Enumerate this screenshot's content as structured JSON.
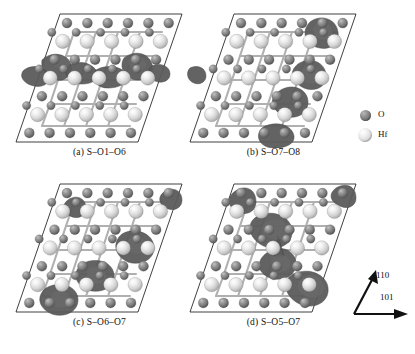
{
  "figure": {
    "kind": "crystal-structure-isosurface-grid",
    "background": "#ffffff",
    "width": 415,
    "height": 354
  },
  "panels": [
    {
      "id": "panel-a",
      "caption": "(a) S–O1–O6",
      "label_letter": "(a)",
      "label_text": "S–O1–O6",
      "position": {
        "left": 12,
        "top": 8
      }
    },
    {
      "id": "panel-b",
      "caption": "(b) S–O7–O8",
      "label_letter": "(b)",
      "label_text": "S–O7–O8",
      "position": {
        "left": 186,
        "top": 8
      }
    },
    {
      "id": "panel-c",
      "caption": "(c) S–O6–O7",
      "label_letter": "(c)",
      "label_text": "S–O6–O7",
      "position": {
        "left": 12,
        "top": 178
      }
    },
    {
      "id": "panel-d",
      "caption": "(d) S–O5–O7",
      "label_letter": "(d)",
      "label_text": "S–O5–O7",
      "position": {
        "left": 186,
        "top": 178
      }
    }
  ],
  "legend": {
    "title": "",
    "items": [
      {
        "symbol": "O",
        "label": "O",
        "icon": "sphere-oxygen-icon",
        "color": "#787878",
        "radius_px": 5.5
      },
      {
        "symbol": "Hf",
        "label": "Hf",
        "icon": "sphere-hafnium-icon",
        "color": "#dcdcdc",
        "radius_px": 7
      }
    ]
  },
  "axes": {
    "vertical": {
      "label": "110",
      "icon": "arrow-up-right-icon"
    },
    "horizontal": {
      "label": "101",
      "icon": "arrow-right-icon"
    }
  },
  "colors": {
    "oxygen": "#787878",
    "hafnium": "#dcdcdc",
    "isosurface": "#5b5b5b",
    "cell_outline": "#2b2b2b",
    "bond": "#b0b0b0",
    "background": "#ffffff"
  }
}
